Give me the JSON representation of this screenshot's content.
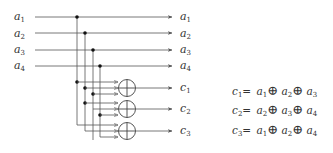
{
  "diagram": {
    "title": "",
    "colors": {
      "line": "#555555",
      "text": "#333333",
      "dot": "#111111"
    },
    "inputs": [
      {
        "label": "a",
        "sub": "1"
      },
      {
        "label": "a",
        "sub": "2"
      },
      {
        "label": "a",
        "sub": "3"
      },
      {
        "label": "a",
        "sub": "4"
      }
    ],
    "pass_outputs": [
      {
        "label": "a",
        "sub": "1"
      },
      {
        "label": "a",
        "sub": "2"
      },
      {
        "label": "a",
        "sub": "3"
      },
      {
        "label": "a",
        "sub": "4"
      }
    ],
    "gates": [
      {
        "type": "xor",
        "symbol": "⊕",
        "output": {
          "label": "c",
          "sub": "1"
        },
        "inputs": [
          "a1",
          "a2",
          "a3"
        ]
      },
      {
        "type": "xor",
        "symbol": "⊕",
        "output": {
          "label": "c",
          "sub": "2"
        },
        "inputs": [
          "a2",
          "a3",
          "a4"
        ]
      },
      {
        "type": "xor",
        "symbol": "⊕",
        "output": {
          "label": "c",
          "sub": "3"
        },
        "inputs": [
          "a1",
          "a2",
          "a4"
        ]
      }
    ],
    "equations": [
      {
        "lhs": "c",
        "lhs_sub": "1",
        "terms": [
          {
            "v": "a",
            "s": "1"
          },
          {
            "v": "a",
            "s": "2"
          },
          {
            "v": "a",
            "s": "3"
          }
        ],
        "op": "⊕",
        "eq": "="
      },
      {
        "lhs": "c",
        "lhs_sub": "2",
        "terms": [
          {
            "v": "a",
            "s": "2"
          },
          {
            "v": "a",
            "s": "3"
          },
          {
            "v": "a",
            "s": "4"
          }
        ],
        "op": "⊕",
        "eq": "="
      },
      {
        "lhs": "c",
        "lhs_sub": "3",
        "terms": [
          {
            "v": "a",
            "s": "1"
          },
          {
            "v": "a",
            "s": "2"
          },
          {
            "v": "a",
            "s": "4"
          }
        ],
        "op": "⊕",
        "eq": "="
      }
    ]
  }
}
